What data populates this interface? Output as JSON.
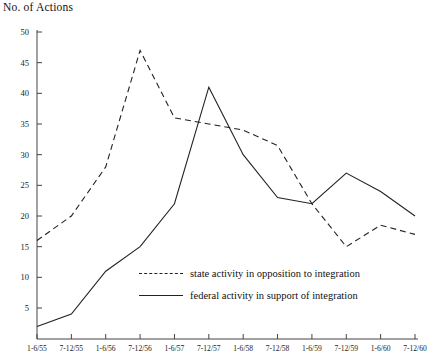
{
  "chart_data": {
    "type": "line",
    "title": "No. of Actions",
    "xlabel": "",
    "ylabel": "No. of Actions",
    "ylim": [
      0,
      50
    ],
    "y_ticks": [
      5,
      10,
      15,
      20,
      25,
      30,
      35,
      40,
      45,
      50
    ],
    "grid": false,
    "legend_position": "inside-center-bottom",
    "categories": [
      "1-6/55",
      "7-12/55",
      "1-6/56",
      "7-12/56",
      "1-6/57",
      "7-12/57",
      "1-6/58",
      "7-12/58",
      "1-6/59",
      "7-12/59",
      "1-6/60",
      "7-12/60"
    ],
    "series": [
      {
        "name": "state activity in opposition to integration",
        "style": "dashed",
        "color": "#222222",
        "values": [
          16,
          20,
          28,
          47,
          36,
          35,
          34,
          31.5,
          22,
          15,
          18.5,
          17
        ]
      },
      {
        "name": "federal activity in support of integration",
        "style": "solid",
        "color": "#222222",
        "values": [
          2,
          4,
          11,
          15,
          22,
          41,
          30,
          23,
          22,
          27,
          24,
          20
        ]
      }
    ]
  },
  "legend": {
    "items": [
      {
        "label": "state activity in opposition to integration",
        "style": "dashed"
      },
      {
        "label": "federal activity in support of integration",
        "style": "solid"
      }
    ]
  }
}
